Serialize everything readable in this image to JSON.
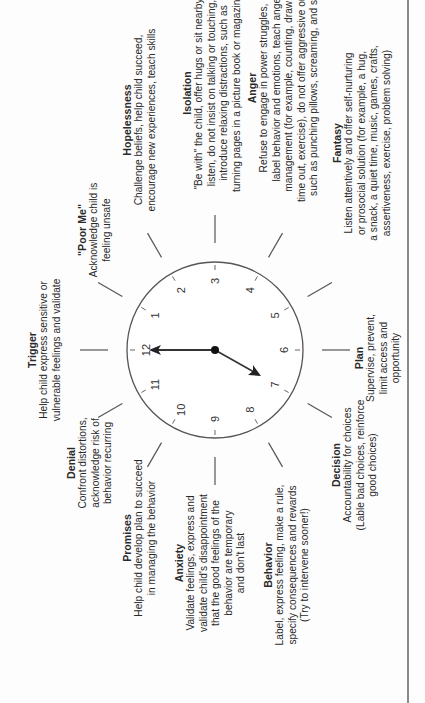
{
  "diagram": {
    "orientation": "rotated 90 degrees counter-clockwise",
    "clock": {
      "numbers": [
        "12",
        "1",
        "2",
        "3",
        "4",
        "5",
        "6",
        "7",
        "8",
        "9",
        "10",
        "11"
      ],
      "hands": {
        "minute_points_to": "12",
        "hour_points_to": "between 7 and 8"
      }
    },
    "stages": [
      {
        "id": "trigger",
        "title": "Trigger",
        "lines": [
          "Help child express sensitive or",
          "vulnerable feelings and validate"
        ]
      },
      {
        "id": "poor-me",
        "title": "\"Poor Me\"",
        "lines": [
          "Acknowledge child is",
          "feeling unsafe"
        ]
      },
      {
        "id": "hopelessness",
        "title": "Hopelessness",
        "lines": [
          "Challenge beliefs, help child succeed,",
          "encourage new experiences, teach skills"
        ]
      },
      {
        "id": "isolation",
        "title": "Isolation",
        "lines": [
          "\"Be with\" the child, offer hugs or sit nearby,",
          "listen, do not insist on talking  or touching,",
          "introduce relaxing distractions,  such as",
          "turning pages in a picture book or magazine"
        ]
      },
      {
        "id": "anger",
        "title": "Anger",
        "lines": [
          "Refuse to engage in power struggles,",
          "label behavior and emotions, teach anger",
          "management (for example, counting, drawing,",
          "time out, exercise), do not offer aggressive outlets,",
          "such as punching pillows,  screaming,  and so on"
        ]
      },
      {
        "id": "fantasy",
        "title": "Fantasy",
        "lines": [
          "Listen attentively and offer self-nurturing",
          "or prosocial solution (for example, a hug,",
          "a snack, a quiet time, music, games, crafts,",
          "assertiveness, exercise, problem solving)"
        ]
      },
      {
        "id": "plan",
        "title": "Plan",
        "lines": [
          "Supervise, prevent,",
          "limit access and",
          "opportunity"
        ]
      },
      {
        "id": "decision",
        "title": "Decision",
        "lines": [
          "Accountability for choices",
          "(Lable bad choices, reinforce",
          "good choices)"
        ]
      },
      {
        "id": "behavior",
        "title": "Behavior",
        "lines": [
          "Label, express feeling, make a rule,",
          "specify consequences and rewards",
          "(Try to intervene sooner!)"
        ]
      },
      {
        "id": "anxiety",
        "title": "Anxiety",
        "lines": [
          "Validate feelings, express and",
          "validate child's disappointment",
          "that the good feelings of the",
          "behavior are temporary",
          "and don't last"
        ]
      },
      {
        "id": "promises",
        "title": "Promises",
        "lines": [
          "Help child develop plan to succeed",
          "in managing the behavior"
        ]
      },
      {
        "id": "denial",
        "title": "Denial",
        "lines": [
          "Confront distortions,",
          "acknowledge risk of",
          "behavior recurring"
        ]
      }
    ]
  }
}
